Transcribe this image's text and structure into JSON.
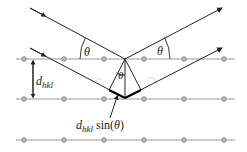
{
  "labels": {
    "theta_left": "θ",
    "theta_right": "θ",
    "theta_center": "θ",
    "d_main": "d",
    "d_sub": "hkl",
    "path_d": "d",
    "path_sub": "hkl",
    "path_sin": "sin(",
    "path_theta": "θ",
    "path_close": ")"
  },
  "lattice": {
    "rows_y": [
      59,
      99,
      140
    ],
    "atoms_x": [
      24,
      64,
      104,
      144,
      184,
      224
    ],
    "line_x": [
      16,
      235
    ]
  },
  "colors": {
    "line": "#9a9a9a",
    "atom_fill": "#bdbdbd",
    "atom_stroke": "#777777",
    "ray": "#222222",
    "path_highlight": "#000000"
  }
}
